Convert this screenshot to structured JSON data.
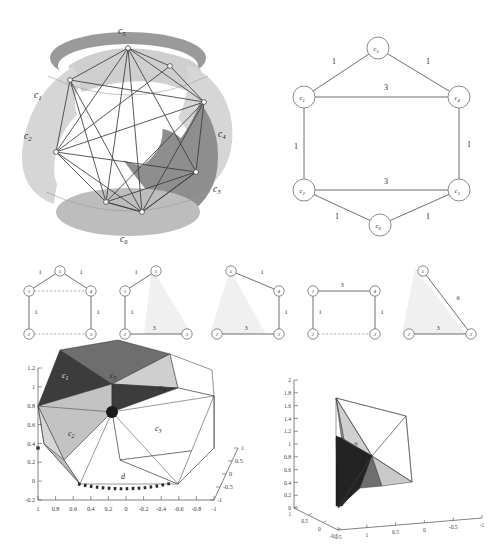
{
  "figure": {
    "title": "",
    "panels": [
      {
        "id": "sphere",
        "name": "3d-sphere-decomposition"
      },
      {
        "id": "graph",
        "name": "hexagonal-weighted-graph"
      },
      {
        "id": "subgraphs",
        "name": "subgraph-row"
      },
      {
        "id": "plot_left",
        "name": "3d-polyhedron-plot-left"
      },
      {
        "id": "plot_right",
        "name": "3d-polyhedron-plot-right"
      }
    ]
  },
  "sphere": {
    "labels": [
      {
        "base": "c",
        "sub": "5",
        "x": 108,
        "y": 28
      },
      {
        "base": "c",
        "sub": "1",
        "x": 24,
        "y": 92
      },
      {
        "base": "c",
        "sub": "2",
        "x": 14,
        "y": 133
      },
      {
        "base": "c",
        "sub": "4",
        "x": 208,
        "y": 131
      },
      {
        "base": "c",
        "sub": "3",
        "x": 203,
        "y": 186
      },
      {
        "base": "c",
        "sub": "6",
        "x": 110,
        "y": 236
      }
    ]
  },
  "graph": {
    "nodes": [
      {
        "id": "c5",
        "base": "c",
        "sub": "5",
        "x": 126,
        "y": 42
      },
      {
        "id": "c1",
        "base": "c",
        "sub": "1",
        "x": 52,
        "y": 91
      },
      {
        "id": "c4",
        "base": "c",
        "sub": "4",
        "x": 207,
        "y": 91
      },
      {
        "id": "c2",
        "base": "c",
        "sub": "2",
        "x": 52,
        "y": 184
      },
      {
        "id": "c3",
        "base": "c",
        "sub": "3",
        "x": 207,
        "y": 184
      },
      {
        "id": "c6",
        "base": "c",
        "sub": "6",
        "x": 128,
        "y": 219
      }
    ],
    "edges": [
      {
        "from": "c1",
        "to": "c5",
        "weight": "1",
        "lx": 82,
        "ly": 58
      },
      {
        "from": "c5",
        "to": "c4",
        "weight": "1",
        "lx": 176,
        "ly": 58
      },
      {
        "from": "c1",
        "to": "c4",
        "weight": "3",
        "lx": 134,
        "ly": 84
      },
      {
        "from": "c1",
        "to": "c2",
        "weight": "1",
        "lx": 44,
        "ly": 143
      },
      {
        "from": "c4",
        "to": "c3",
        "weight": "1",
        "lx": 217,
        "ly": 141
      },
      {
        "from": "c2",
        "to": "c3",
        "weight": "3",
        "lx": 134,
        "ly": 178
      },
      {
        "from": "c2",
        "to": "c6",
        "weight": "1",
        "lx": 85,
        "ly": 213
      },
      {
        "from": "c6",
        "to": "c3",
        "weight": "1",
        "lx": 176,
        "ly": 213
      }
    ]
  },
  "subgraphs": [
    {
      "name": "subgraph-1",
      "nodes": [
        {
          "id": "5",
          "x": 48,
          "y": 9
        },
        {
          "id": "1",
          "x": 17,
          "y": 29
        },
        {
          "id": "4",
          "x": 79,
          "y": 29
        },
        {
          "id": "2",
          "x": 17,
          "y": 72
        },
        {
          "id": "3",
          "x": 79,
          "y": 72
        }
      ],
      "edges": [
        {
          "from": "1",
          "to": "5",
          "weight": "1",
          "style": "solid",
          "lx": 28,
          "ly": 12
        },
        {
          "from": "5",
          "to": "4",
          "weight": "1",
          "style": "solid",
          "lx": 69,
          "ly": 12
        },
        {
          "from": "1",
          "to": "4",
          "weight": "",
          "style": "dashed",
          "lx": 0,
          "ly": 0
        },
        {
          "from": "1",
          "to": "2",
          "weight": "1",
          "style": "solid",
          "lx": 24,
          "ly": 52
        },
        {
          "from": "4",
          "to": "3",
          "weight": "1",
          "style": "solid",
          "lx": 86,
          "ly": 52
        },
        {
          "from": "2",
          "to": "3",
          "weight": "",
          "style": "dashed",
          "lx": 0,
          "ly": 0
        }
      ]
    },
    {
      "name": "subgraph-2",
      "nodes": [
        {
          "id": "5",
          "x": 48,
          "y": 9
        },
        {
          "id": "1",
          "x": 17,
          "y": 29
        },
        {
          "id": "2",
          "x": 17,
          "y": 72
        },
        {
          "id": "3",
          "x": 79,
          "y": 72
        }
      ],
      "edges": [
        {
          "from": "1",
          "to": "5",
          "weight": "1",
          "style": "solid",
          "lx": 28,
          "ly": 12
        },
        {
          "from": "1",
          "to": "2",
          "weight": "1",
          "style": "solid",
          "lx": 24,
          "ly": 52
        },
        {
          "from": "2",
          "to": "3",
          "weight": "3",
          "style": "solid",
          "lx": 46,
          "ly": 68
        }
      ]
    },
    {
      "name": "subgraph-3",
      "nodes": [
        {
          "id": "5",
          "x": 31,
          "y": 9
        },
        {
          "id": "4",
          "x": 79,
          "y": 29
        },
        {
          "id": "2",
          "x": 17,
          "y": 72
        },
        {
          "id": "3",
          "x": 79,
          "y": 72
        }
      ],
      "edges": [
        {
          "from": "5",
          "to": "4",
          "weight": "1",
          "style": "solid",
          "lx": 62,
          "ly": 12
        },
        {
          "from": "4",
          "to": "3",
          "weight": "1",
          "style": "solid",
          "lx": 86,
          "ly": 52
        },
        {
          "from": "2",
          "to": "3",
          "weight": "3",
          "style": "solid",
          "lx": 46,
          "ly": 68
        }
      ]
    },
    {
      "name": "subgraph-4",
      "nodes": [
        {
          "id": "1",
          "x": 17,
          "y": 29
        },
        {
          "id": "4",
          "x": 79,
          "y": 29
        },
        {
          "id": "2",
          "x": 17,
          "y": 72
        },
        {
          "id": "3",
          "x": 79,
          "y": 72
        }
      ],
      "edges": [
        {
          "from": "1",
          "to": "4",
          "weight": "3",
          "style": "solid",
          "lx": 46,
          "ly": 25
        },
        {
          "from": "1",
          "to": "2",
          "weight": "1",
          "style": "solid",
          "lx": 24,
          "ly": 52
        },
        {
          "from": "4",
          "to": "3",
          "weight": "1",
          "style": "solid",
          "lx": 86,
          "ly": 52
        },
        {
          "from": "2",
          "to": "3",
          "weight": "",
          "style": "dashed",
          "lx": 0,
          "ly": 0
        }
      ]
    },
    {
      "name": "subgraph-5",
      "nodes": [
        {
          "id": "5",
          "x": 31,
          "y": 9
        },
        {
          "id": "2",
          "x": 17,
          "y": 72
        },
        {
          "id": "3",
          "x": 79,
          "y": 72
        }
      ],
      "edges": [
        {
          "from": "5",
          "to": "3",
          "weight": "6",
          "style": "solid",
          "lx": 66,
          "ly": 38
        },
        {
          "from": "2",
          "to": "3",
          "weight": "3",
          "style": "solid",
          "lx": 46,
          "ly": 68
        }
      ]
    }
  ],
  "plot_left": {
    "name": "3d-polyhedron-plot-left",
    "y_ticks": [
      "1.2",
      "1",
      "0.8",
      "0.6",
      "0.4",
      "0.2",
      "0",
      "-0.2"
    ],
    "ylim": [
      -0.2,
      1.2
    ],
    "x_ticks": [
      "1",
      "0.8",
      "0.6",
      "0.4",
      "0.2",
      "0",
      "-0.2",
      "-0.4",
      "-0.6",
      "-0.8",
      "-1"
    ],
    "xlim": [
      1,
      -1
    ],
    "z_ticks": [
      "1",
      "0.5",
      "0",
      "-0.5",
      "-1"
    ],
    "zlim": [
      1,
      -1
    ],
    "face_labels": [
      {
        "base": "c",
        "sub": "1",
        "x": 60,
        "y": 30,
        "light": true
      },
      {
        "base": "c",
        "sub": "5",
        "x": 108,
        "y": 30,
        "light": false
      },
      {
        "base": "c",
        "sub": "4",
        "x": 157,
        "y": 42,
        "light": false
      },
      {
        "base": "c",
        "sub": "2",
        "x": 66,
        "y": 88,
        "light": false
      },
      {
        "base": "c",
        "sub": "3",
        "x": 153,
        "y": 83,
        "light": false
      }
    ],
    "annotation": {
      "text": "d",
      "x": 121,
      "y": 480
    }
  },
  "plot_right": {
    "name": "3d-polyhedron-plot-right",
    "y_ticks": [
      "2",
      "1.8",
      "1.6",
      "1.4",
      "1.2",
      "1",
      "0.8",
      "0.6",
      "0.4",
      "0.2",
      "0"
    ],
    "ylim": [
      0,
      2
    ],
    "x_ticks": [
      "1",
      "0.5",
      "0",
      "-0.5"
    ],
    "xlim": [
      1,
      -0.5
    ],
    "z_ticks": [
      "1.5",
      "1",
      "0.5",
      "0",
      "-0.5",
      "-1"
    ],
    "zlim": [
      1.5,
      -1
    ]
  },
  "colors": {
    "line": "#3b3b3b",
    "axis": "#4a4a4a",
    "face_dark": "#3c3c3c",
    "face_mid": "#6e6e6e",
    "face_grey": "#a8a8a8",
    "face_light": "#d3d3d3",
    "face_white": "#ffffff",
    "ghost": "#e9e9e9",
    "band_dark": "#8e8e8e",
    "band_light": "#cfcfcf"
  }
}
